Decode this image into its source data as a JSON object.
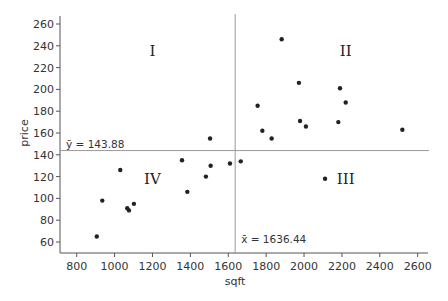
{
  "chart_data": {
    "type": "scatter",
    "title": "",
    "xlabel": "sqft",
    "ylabel": "price",
    "xlim": [
      720,
      2660
    ],
    "ylim": [
      50,
      266
    ],
    "x_ticks": [
      800,
      1000,
      1200,
      1400,
      1600,
      1800,
      2000,
      2200,
      2400,
      2600
    ],
    "y_ticks": [
      60,
      80,
      100,
      120,
      140,
      160,
      180,
      200,
      220,
      240,
      260
    ],
    "grid": false,
    "legend": "none",
    "series": [
      {
        "name": "houses",
        "color": "#222222",
        "points": [
          {
            "x": 906,
            "y": 65
          },
          {
            "x": 935,
            "y": 98
          },
          {
            "x": 1030,
            "y": 126
          },
          {
            "x": 1067,
            "y": 91
          },
          {
            "x": 1076,
            "y": 89
          },
          {
            "x": 1102,
            "y": 95
          },
          {
            "x": 1356,
            "y": 135
          },
          {
            "x": 1384,
            "y": 106
          },
          {
            "x": 1482,
            "y": 120
          },
          {
            "x": 1504,
            "y": 155
          },
          {
            "x": 1507,
            "y": 130
          },
          {
            "x": 1609,
            "y": 132
          },
          {
            "x": 1666,
            "y": 134
          },
          {
            "x": 1755,
            "y": 185
          },
          {
            "x": 1780,
            "y": 162
          },
          {
            "x": 1829,
            "y": 155
          },
          {
            "x": 1882,
            "y": 246
          },
          {
            "x": 1973,
            "y": 206
          },
          {
            "x": 1979,
            "y": 171
          },
          {
            "x": 2010,
            "y": 166
          },
          {
            "x": 2111,
            "y": 118
          },
          {
            "x": 2181,
            "y": 170
          },
          {
            "x": 2190,
            "y": 201
          },
          {
            "x": 2220,
            "y": 188
          },
          {
            "x": 2519,
            "y": 163
          }
        ]
      }
    ],
    "reference_lines": {
      "x_mean": {
        "value": 1636.44,
        "label": "x̄ = 1636.44",
        "color": "#999999"
      },
      "y_mean": {
        "value": 143.88,
        "label": "ȳ = 143.88",
        "color": "#999999"
      }
    },
    "annotations": [
      {
        "text": "I",
        "x": 1200,
        "y": 235
      },
      {
        "text": "II",
        "x": 2220,
        "y": 235
      },
      {
        "text": "III",
        "x": 2220,
        "y": 118
      },
      {
        "text": "IV",
        "x": 1200,
        "y": 118
      }
    ],
    "axis_color": "#555555"
  }
}
